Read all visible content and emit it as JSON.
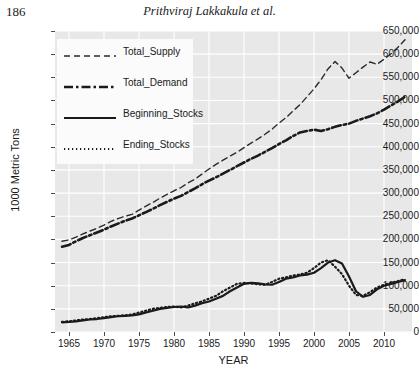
{
  "header": {
    "folio": "186",
    "running_title": "Prithviraj Lakkakula et al."
  },
  "chart_data": {
    "type": "line",
    "title": "",
    "xlabel": "YEAR",
    "ylabel": "1000 Metric Tons",
    "xlim": [
      1963,
      2014
    ],
    "ylim": [
      0,
      650000
    ],
    "grid": true,
    "legend_position": "top-left",
    "xticks": [
      1965,
      1970,
      1975,
      1980,
      1985,
      1990,
      1995,
      2000,
      2005,
      2010
    ],
    "xtick_labels": [
      "1965",
      "1970",
      "1975",
      "1980",
      "1985",
      "1990",
      "1995",
      "2000",
      "2005",
      "2010"
    ],
    "yticks": [
      0,
      50000,
      100000,
      150000,
      200000,
      250000,
      300000,
      350000,
      400000,
      450000,
      500000,
      550000,
      600000,
      650000
    ],
    "ytick_labels": [
      "0",
      "50,000",
      "100,000",
      "150,000",
      "200,000",
      "250,000",
      "300,000",
      "350,000",
      "400,000",
      "450,000",
      "500,000",
      "550,000",
      "600,000",
      "650,000"
    ],
    "x": [
      1964,
      1965,
      1966,
      1967,
      1968,
      1969,
      1970,
      1971,
      1972,
      1973,
      1974,
      1975,
      1976,
      1977,
      1978,
      1979,
      1980,
      1981,
      1982,
      1983,
      1984,
      1985,
      1986,
      1987,
      1988,
      1989,
      1990,
      1991,
      1992,
      1993,
      1994,
      1995,
      1996,
      1997,
      1998,
      1999,
      2000,
      2001,
      2002,
      2003,
      2004,
      2005,
      2006,
      2007,
      2008,
      2009,
      2010,
      2011,
      2012,
      2013
    ],
    "series": [
      {
        "name": "Total_Supply",
        "style": "dashed",
        "color": "#2b2b2b",
        "width": 1.4,
        "values": [
          196000,
          199000,
          205000,
          212000,
          218000,
          224000,
          231000,
          239000,
          245000,
          250000,
          254000,
          263000,
          272000,
          280000,
          289000,
          297000,
          305000,
          312000,
          322000,
          330000,
          341000,
          352000,
          362000,
          371000,
          380000,
          388000,
          398000,
          408000,
          417000,
          427000,
          438000,
          451000,
          463000,
          477000,
          491000,
          508000,
          525000,
          545000,
          568000,
          584000,
          570000,
          548000,
          560000,
          572000,
          583000,
          578000,
          589000,
          601000,
          615000,
          631000
        ]
      },
      {
        "name": "Total_Demand",
        "style": "dashdot",
        "color": "#1a1a1a",
        "width": 2.6,
        "values": [
          184000,
          188000,
          196000,
          203000,
          209000,
          215000,
          221000,
          228000,
          234000,
          240000,
          245000,
          252000,
          259000,
          266000,
          274000,
          281000,
          288000,
          294000,
          302000,
          310000,
          319000,
          327000,
          334000,
          342000,
          350000,
          358000,
          366000,
          374000,
          381000,
          389000,
          397000,
          406000,
          414000,
          423000,
          431000,
          434000,
          437000,
          434000,
          438000,
          443000,
          447000,
          450000,
          456000,
          461000,
          466000,
          472000,
          480000,
          489000,
          498000,
          508000
        ]
      },
      {
        "name": "Beginning_Stocks",
        "style": "solid",
        "color": "#1a1a1a",
        "width": 2.2,
        "values": [
          21000,
          22000,
          23000,
          25000,
          27000,
          28000,
          30000,
          32000,
          34000,
          35000,
          36000,
          38000,
          42000,
          46000,
          50000,
          52000,
          54000,
          55000,
          53000,
          57000,
          62000,
          66000,
          72000,
          78000,
          88000,
          96000,
          104000,
          106000,
          105000,
          103000,
          102000,
          108000,
          115000,
          118000,
          122000,
          124000,
          128000,
          138000,
          150000,
          155000,
          148000,
          120000,
          88000,
          76000,
          80000,
          92000,
          100000,
          104000,
          108000,
          112000
        ]
      },
      {
        "name": "Ending_Stocks",
        "style": "dotted",
        "color": "#1a1a1a",
        "width": 2.2,
        "values": [
          22000,
          23000,
          25000,
          27000,
          28000,
          30000,
          32000,
          34000,
          35000,
          36000,
          38000,
          42000,
          46000,
          50000,
          52000,
          54000,
          55000,
          53000,
          57000,
          62000,
          66000,
          72000,
          78000,
          88000,
          96000,
          104000,
          106000,
          105000,
          103000,
          102000,
          108000,
          115000,
          118000,
          122000,
          124000,
          128000,
          138000,
          150000,
          155000,
          141000,
          125000,
          100000,
          80000,
          78000,
          86000,
          96000,
          102000,
          106000,
          110000,
          114000
        ]
      }
    ]
  },
  "legend": {
    "items": [
      {
        "label": "Total_Supply",
        "style": "dashed"
      },
      {
        "label": "Total_Demand",
        "style": "dashdot"
      },
      {
        "label": "Beginning_Stocks",
        "style": "solid"
      },
      {
        "label": "Ending_Stocks",
        "style": "dotted"
      }
    ]
  }
}
